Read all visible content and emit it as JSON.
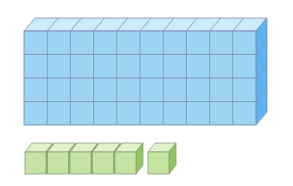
{
  "diagram": {
    "tens_block": {
      "rows": 4,
      "cols": 10,
      "count": 40
    },
    "unit_cubes": {
      "group": 5,
      "separate": 1,
      "count": 6
    },
    "total": 46
  },
  "colors": {
    "blue_front": "#9dd3f3",
    "blue_top": "#cdebfb",
    "blue_side": "#5cb3ee",
    "blue_line": "#7d8fb8",
    "green_front": "#c6e3a4",
    "green_top": "#e1f1cd",
    "green_side": "#8fc65f",
    "green_line": "#8aa07a"
  }
}
